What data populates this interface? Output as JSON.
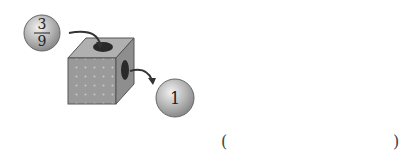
{
  "diagram": {
    "input_ball": {
      "numerator": "3",
      "denominator": "9"
    },
    "output_ball": {
      "label": "1"
    },
    "box": {
      "description": "dotted cube machine with hole on top and side"
    }
  },
  "answer_blank": {
    "open": "(",
    "close": ")",
    "value": ""
  }
}
